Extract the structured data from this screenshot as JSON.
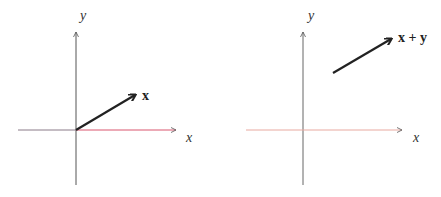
{
  "panels": [
    {
      "y_axis_label": "y",
      "x_axis_label": "x",
      "vector_label": "x",
      "x_axis_color": "#d9576e",
      "x_axis_left_color": "#8a7a88",
      "y_axis_color": "#555555",
      "vector_color": "#222222"
    },
    {
      "y_axis_label": "y",
      "x_axis_label": "x",
      "vector_label": "x + y",
      "x_axis_color": "#e8a9a0",
      "y_axis_color": "#666666",
      "vector_color": "#222222"
    }
  ]
}
